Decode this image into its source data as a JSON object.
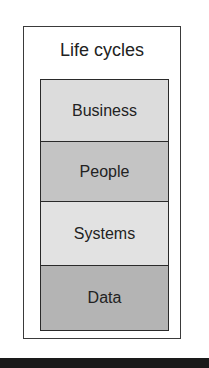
{
  "diagram": {
    "title": "Life cycles",
    "layers": [
      {
        "label": "Business",
        "fill": "#dcdcdc",
        "height": 62
      },
      {
        "label": "People",
        "fill": "#c4c4c4",
        "height": 60
      },
      {
        "label": "Systems",
        "fill": "#e2e2e2",
        "height": 64
      },
      {
        "label": "Data",
        "fill": "#b4b4b4",
        "height": 64
      }
    ]
  }
}
